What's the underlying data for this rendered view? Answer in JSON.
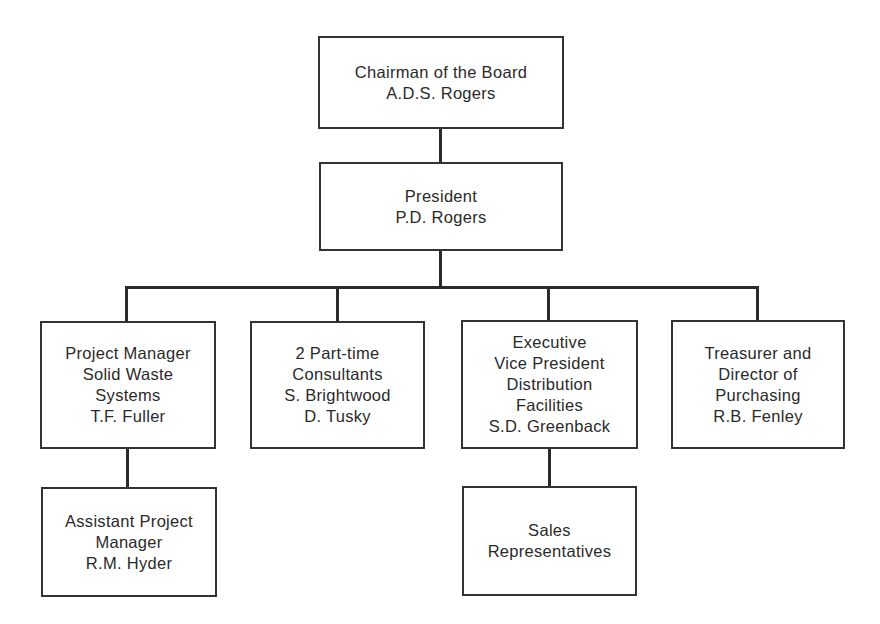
{
  "chart": {
    "type": "organization-chart",
    "nodes": [
      {
        "id": "chairman",
        "lines": [
          "Chairman of the Board",
          "A.D.S. Rogers"
        ]
      },
      {
        "id": "president",
        "lines": [
          "President",
          "P.D. Rogers"
        ]
      },
      {
        "id": "project_manager",
        "lines": [
          "Project Manager",
          "Solid Waste",
          "Systems",
          "T.F. Fuller"
        ]
      },
      {
        "id": "consultants",
        "lines": [
          "2 Part-time",
          "Consultants",
          "S. Brightwood",
          "D. Tusky"
        ]
      },
      {
        "id": "exec_vp",
        "lines": [
          "Executive",
          "Vice President",
          "Distribution",
          "Facilities",
          "S.D. Greenback"
        ]
      },
      {
        "id": "treasurer",
        "lines": [
          "Treasurer and",
          "Director of",
          "Purchasing",
          "R.B. Fenley"
        ]
      },
      {
        "id": "asst_project_manager",
        "lines": [
          "Assistant Project",
          "Manager",
          "R.M. Hyder"
        ]
      },
      {
        "id": "sales_reps",
        "lines": [
          "Sales",
          "Representatives"
        ]
      }
    ],
    "edges": [
      [
        "chairman",
        "president"
      ],
      [
        "president",
        "project_manager"
      ],
      [
        "president",
        "consultants"
      ],
      [
        "president",
        "exec_vp"
      ],
      [
        "president",
        "treasurer"
      ],
      [
        "project_manager",
        "asst_project_manager"
      ],
      [
        "exec_vp",
        "sales_reps"
      ]
    ]
  }
}
